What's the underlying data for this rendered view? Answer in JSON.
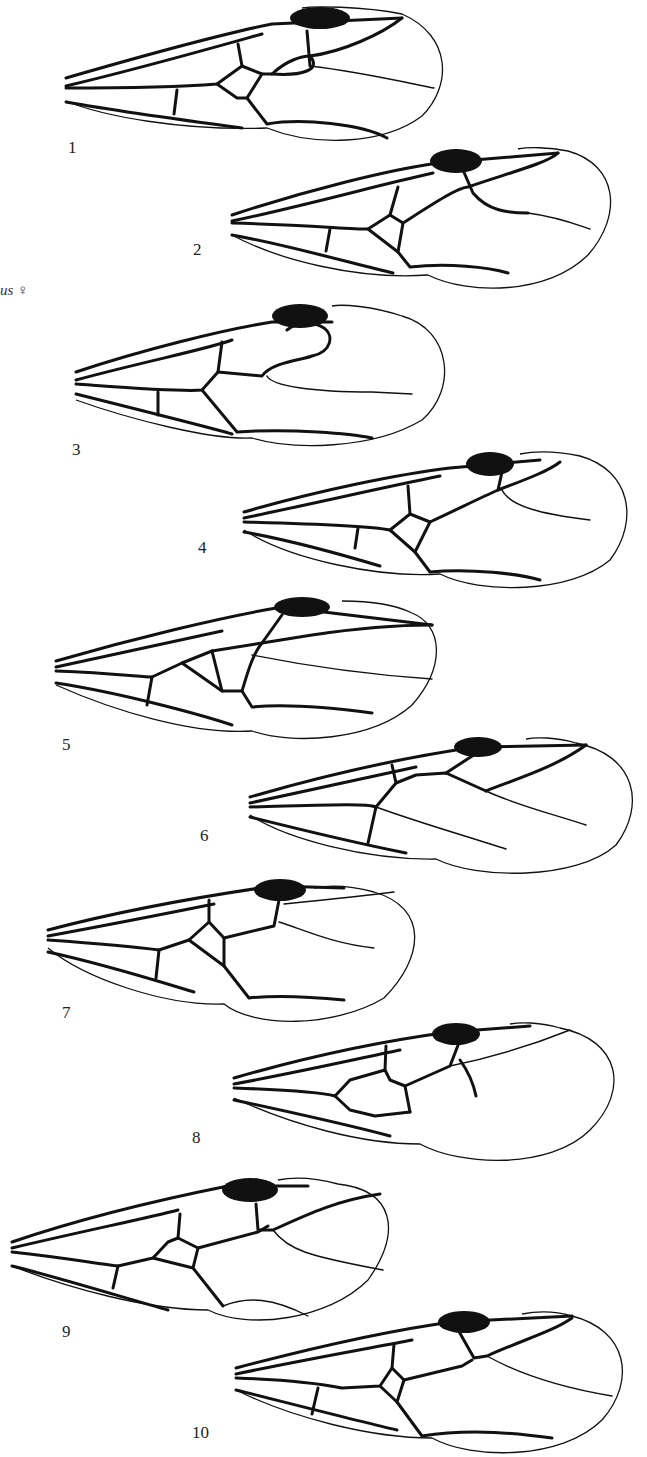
{
  "figure": {
    "caption_fragment": "us ♀",
    "panels": [
      {
        "label": "1",
        "x": 62,
        "y": 6,
        "w": 385,
        "h": 140,
        "label_x": 68,
        "label_y": 138
      },
      {
        "label": "2",
        "x": 228,
        "y": 145,
        "w": 385,
        "h": 150,
        "label_x": 193,
        "label_y": 240
      },
      {
        "label": "3",
        "x": 72,
        "y": 300,
        "w": 380,
        "h": 150,
        "label_x": 72,
        "label_y": 440
      },
      {
        "label": "4",
        "x": 240,
        "y": 450,
        "w": 390,
        "h": 148,
        "label_x": 198,
        "label_y": 538
      },
      {
        "label": "5",
        "x": 52,
        "y": 595,
        "w": 390,
        "h": 150,
        "label_x": 62,
        "label_y": 735
      },
      {
        "label": "6",
        "x": 246,
        "y": 735,
        "w": 388,
        "h": 148,
        "label_x": 200,
        "label_y": 826
      },
      {
        "label": "7",
        "x": 44,
        "y": 878,
        "w": 382,
        "h": 150,
        "label_x": 62,
        "label_y": 1003
      },
      {
        "label": "8",
        "x": 230,
        "y": 1020,
        "w": 390,
        "h": 150,
        "label_x": 192,
        "label_y": 1128
      },
      {
        "label": "9",
        "x": 8,
        "y": 1170,
        "w": 385,
        "h": 155,
        "label_x": 62,
        "label_y": 1322
      },
      {
        "label": "10",
        "x": 232,
        "y": 1310,
        "w": 400,
        "h": 147,
        "label_x": 192,
        "label_y": 1423
      }
    ]
  }
}
